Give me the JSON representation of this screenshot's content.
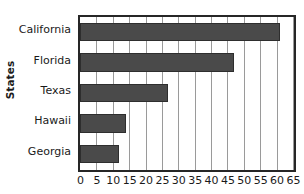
{
  "chart_data": {
    "type": "bar",
    "orientation": "horizontal",
    "title": "",
    "xlabel": "",
    "ylabel": "States",
    "categories": [
      "California",
      "Florida",
      "Texas",
      "Hawaii",
      "Georgia"
    ],
    "values": [
      61,
      47,
      27,
      14,
      12
    ],
    "series": [
      {
        "name": "States",
        "values": [
          61,
          47,
          27,
          14,
          12
        ]
      }
    ],
    "xticks": [
      0,
      5,
      10,
      15,
      20,
      25,
      30,
      35,
      40,
      45,
      50,
      55,
      60,
      65
    ],
    "xticklabels": [
      "0",
      "5",
      "10",
      "15",
      "20",
      "25",
      "30",
      "35",
      "40",
      "45",
      "50",
      "55",
      "60",
      "65"
    ],
    "xlim": [
      0,
      65
    ],
    "grid": "vertical",
    "legend": "none",
    "bar_color": "#4a4a4a",
    "gridline_color": "#9a9a9a",
    "frame_color": "#262626",
    "background": "#ffffff"
  }
}
